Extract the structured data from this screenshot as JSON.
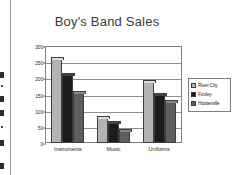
{
  "document": {
    "left_toolbar_name": "cut-off-toolbar"
  },
  "chart_data": {
    "type": "bar",
    "title": "Boy's Band Sales",
    "xlabel": "",
    "ylabel": "",
    "ylim": [
      0,
      300
    ],
    "yticks": [
      "0",
      "50",
      "100",
      "150",
      "200",
      "250",
      "300"
    ],
    "ytick_values": [
      0,
      50,
      100,
      150,
      200,
      250,
      300
    ],
    "grid": true,
    "legend_position": "right",
    "categories": [
      "Instruments",
      "Music",
      "Uniforms"
    ],
    "series": [
      {
        "name": "River City",
        "color": "#b3b3b3",
        "values": [
          260,
          78,
          190
        ]
      },
      {
        "name": "Foxley",
        "color": "#1c1c1c",
        "values": [
          210,
          62,
          150
        ]
      },
      {
        "name": "Hooterville",
        "color": "#5e5e5e",
        "values": [
          155,
          38,
          128
        ]
      }
    ]
  }
}
